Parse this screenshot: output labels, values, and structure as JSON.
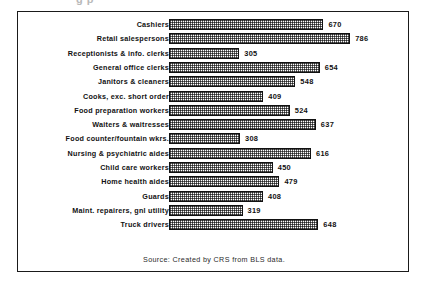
{
  "figure": {
    "top_remnant_text": "g   p",
    "source_note": "Source:  Created by CRS from BLS data."
  },
  "chart_data": {
    "type": "bar",
    "orientation": "horizontal",
    "title": "",
    "subtitle": "",
    "xlabel": "",
    "ylabel": "",
    "xlim": [
      0,
      800
    ],
    "grid": false,
    "legend": "none",
    "value_labels": true,
    "bar_fill": "stippled-gray-pattern",
    "bar_border_color": "#111111",
    "categories": [
      "Cashiers",
      "Retail salespersons",
      "Receptionists & info. clerks",
      "General office clerks",
      "Janitors & cleaners",
      "Cooks, exc. short order",
      "Food preparation workers",
      "Waiters & waitresses",
      "Food counter/fountain wkrs.",
      "Nursing & psychiatric aides",
      "Child care workers",
      "Home health aides",
      "Guards",
      "Maint. repairers, gnl utility",
      "Truck drivers"
    ],
    "values": [
      670,
      786,
      305,
      654,
      548,
      409,
      524,
      637,
      308,
      616,
      450,
      479,
      408,
      319,
      648
    ],
    "annotations": [
      "Source:  Created by CRS from BLS data."
    ]
  }
}
